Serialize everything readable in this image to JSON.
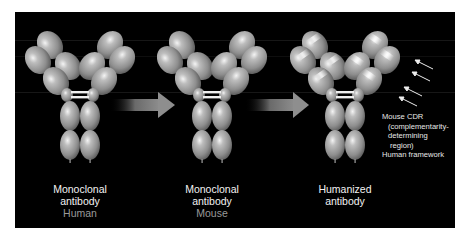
{
  "figure": {
    "background": "#000000",
    "panels": [
      {
        "id": "human",
        "title_line1": "Monoclonal",
        "title_line2": "antibody",
        "subtitle": "Human"
      },
      {
        "id": "mouse",
        "title_line1": "Monoclonal",
        "title_line2": "antibody",
        "subtitle": "Mouse"
      },
      {
        "id": "humanized",
        "title_line1": "Humanized",
        "title_line2": "antibody",
        "subtitle": ""
      }
    ],
    "legend": {
      "line1": "Mouse CDR",
      "line2": "(complementarity-",
      "line3": "determining",
      "line4": "region)",
      "line5": "Human framework"
    },
    "arrows": [
      {
        "from": "human",
        "to": "mouse",
        "icon": "right-arrow-icon"
      },
      {
        "from": "mouse",
        "to": "humanized",
        "icon": "right-arrow-icon"
      }
    ],
    "colors": {
      "domain_fill": "#9a9a9a",
      "domain_highlight": "#e8e8e8",
      "arrow": "#8c8c8c",
      "caption_text": "#f2f2f2",
      "subtitle_text": "#9a9a9a"
    }
  }
}
